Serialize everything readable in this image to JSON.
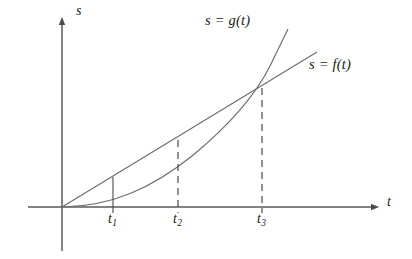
{
  "figure": {
    "kind": "cartesian-diagram",
    "background_color": "#ffffff",
    "stroke_color": "#6e6e6e",
    "axis_color": "#5a5a5a",
    "text_color": "#1a1a1a",
    "axes": {
      "y_axis_label": "s",
      "x_axis_label": "t",
      "origin": {
        "x": 62,
        "y": 207
      },
      "x_axis_end": {
        "x": 379,
        "y": 207
      },
      "y_axis_top": {
        "x": 62,
        "y": 18
      },
      "y_axis_bottom": {
        "x": 62,
        "y": 251
      }
    },
    "curves": [
      {
        "name": "g-curve",
        "label": "s = g(t)",
        "shape": "convex-increasing",
        "label_position": {
          "x": 205,
          "y": 13
        },
        "path": "M 62 207 C 110 206 150 190 190 158 C 225 130 255 98 272 62 L 288 29",
        "start": {
          "x": 62,
          "y": 207
        },
        "end": {
          "x": 288,
          "y": 29
        }
      },
      {
        "name": "f-line",
        "label": "s = f(t)",
        "shape": "straight-increasing",
        "label_position": {
          "x": 310,
          "y": 58
        },
        "path": "M 62 207 L 317 52",
        "start": {
          "x": 62,
          "y": 207
        },
        "end": {
          "x": 317,
          "y": 52
        }
      }
    ],
    "intersection": {
      "x": 262,
      "y": 87,
      "label": "t3-intersection"
    },
    "ticks": [
      {
        "name": "t1",
        "label": "t",
        "subscript": "1",
        "x": 113,
        "label_x": 108,
        "label_y": 212,
        "connector_style": "solid",
        "connector_top_y": 178,
        "connector_bottom_y": 207
      },
      {
        "name": "t2",
        "label": "t",
        "subscript": "2",
        "x": 178,
        "label_x": 173,
        "label_y": 212,
        "connector_style": "dashed",
        "connector_top_y": 141,
        "connector_bottom_y": 207
      },
      {
        "name": "t3",
        "label": "t",
        "subscript": "3",
        "x": 262,
        "label_x": 257,
        "label_y": 212,
        "connector_style": "dashed",
        "connector_top_y": 88,
        "connector_bottom_y": 207
      }
    ],
    "axis_label_positions": {
      "y_label": {
        "x": 76,
        "y": 4
      },
      "x_label": {
        "x": 387,
        "y": 196
      }
    }
  }
}
